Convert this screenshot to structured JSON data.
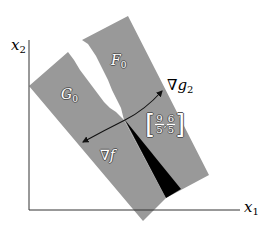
{
  "axes": {
    "x_label": "x",
    "x_sub": "1",
    "y_label": "x",
    "y_sub": "2"
  },
  "regions": {
    "g0": {
      "label": "G",
      "sub": "0",
      "fill": "#999999"
    },
    "f0": {
      "label": "F",
      "sub": "0",
      "fill": "#999999"
    },
    "cone": {
      "fill": "#000000"
    }
  },
  "point": {
    "x_num": "9",
    "x_den": "5",
    "y_num": "6",
    "y_den": "5",
    "left_bracket": "[",
    "right_bracket": "]",
    "comma": ","
  },
  "vectors": {
    "grad_g2": {
      "label": "∇g",
      "sub": "2"
    },
    "grad_f": {
      "label": "∇f"
    }
  },
  "colors": {
    "band": "#999999",
    "axis": "#333333",
    "arrow": "#111111"
  }
}
